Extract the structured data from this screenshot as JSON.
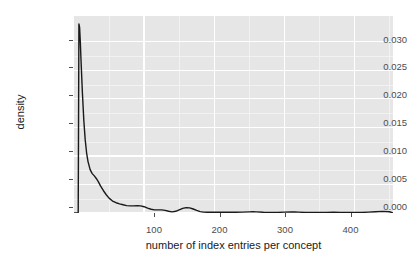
{
  "chart_data": {
    "type": "line",
    "title": "",
    "subtitle": "",
    "xlabel": "number of index entries per concept",
    "ylabel": "density",
    "xlim": [
      0,
      455
    ],
    "ylim": [
      0,
      0.0345
    ],
    "xticks": [
      100,
      200,
      300,
      400
    ],
    "xtick_labels": [
      "100",
      "200",
      "300",
      "400"
    ],
    "yticks": [
      0.0,
      0.005,
      0.01,
      0.015,
      0.02,
      0.025,
      0.03
    ],
    "ytick_labels": [
      "0.000",
      "0.005",
      "0.010",
      "0.015",
      "0.020",
      "0.025",
      "0.030"
    ],
    "grid": true,
    "grid_minor": true,
    "legend": null,
    "legend_position": "none",
    "panel_background": "#e6e6e6",
    "grid_color": "#ffffff",
    "line_color": "#1a1a1a",
    "line_width": 1.4,
    "series": [
      {
        "name": "density",
        "x": [
          0,
          2,
          4,
          5,
          6,
          7,
          8,
          9,
          10,
          12,
          14,
          16,
          18,
          20,
          23,
          26,
          29,
          32,
          35,
          38,
          42,
          46,
          50,
          55,
          60,
          65,
          70,
          75,
          80,
          85,
          90,
          95,
          100,
          105,
          110,
          115,
          120,
          125,
          130,
          135,
          140,
          145,
          150,
          155,
          160,
          165,
          170,
          175,
          180,
          185,
          190,
          195,
          200,
          210,
          220,
          230,
          240,
          250,
          255,
          260,
          270,
          280,
          290,
          300,
          310,
          315,
          320,
          330,
          340,
          350,
          360,
          370,
          380,
          390,
          400,
          410,
          420,
          430,
          440,
          450,
          455
        ],
        "y": [
          0.0,
          0.0,
          0.0,
          0.0,
          0.0001,
          0.0331,
          0.0325,
          0.03,
          0.0268,
          0.021,
          0.0162,
          0.0128,
          0.0105,
          0.009,
          0.0076,
          0.0069,
          0.0065,
          0.006,
          0.0054,
          0.0047,
          0.0039,
          0.0032,
          0.0026,
          0.0021,
          0.0018,
          0.0016,
          0.00145,
          0.0013,
          0.00125,
          0.00125,
          0.0013,
          0.00125,
          0.0011,
          0.00085,
          0.00065,
          0.00055,
          0.00055,
          0.00055,
          0.00045,
          0.0003,
          0.0002,
          0.0003,
          0.00055,
          0.0008,
          0.00095,
          0.0009,
          0.0007,
          0.00045,
          0.00025,
          0.00015,
          0.00012,
          0.00012,
          0.00012,
          0.00012,
          0.00012,
          0.00012,
          0.00015,
          0.0002,
          0.00022,
          0.0002,
          0.00012,
          8e-05,
          0.0001,
          0.00015,
          0.00018,
          0.00018,
          0.00015,
          0.0001,
          8e-05,
          8e-05,
          0.0001,
          0.00012,
          0.0001,
          8e-05,
          8e-05,
          0.0001,
          0.00015,
          0.00022,
          0.00028,
          0.00022,
          0.0
        ]
      }
    ]
  },
  "axes": {
    "y_labels": [
      "0.030",
      "0.025",
      "0.020",
      "0.015",
      "0.010",
      "0.005",
      "0.000"
    ],
    "x_labels": [
      "100",
      "200",
      "300",
      "400"
    ],
    "y_title": "density",
    "x_title": "number of index entries per concept"
  }
}
